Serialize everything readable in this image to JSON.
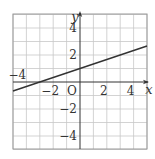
{
  "chart_data": {
    "type": "line",
    "title": "",
    "xlabel": "x",
    "ylabel": "y",
    "origin_label": "O",
    "xlim": [
      -5,
      5
    ],
    "ylim": [
      -5,
      5
    ],
    "grid": true,
    "grid_step": 1,
    "x_tick_labels": [
      {
        "value": -4,
        "text": "−4"
      },
      {
        "value": -2,
        "text": "−2"
      },
      {
        "value": 2,
        "text": "2"
      },
      {
        "value": 4,
        "text": "4"
      }
    ],
    "y_tick_labels": [
      {
        "value": 4,
        "text": "4"
      },
      {
        "value": 2,
        "text": "2"
      },
      {
        "value": -2,
        "text": "−2"
      },
      {
        "value": -4,
        "text": "−4"
      }
    ],
    "series": [
      {
        "name": "y = (1/3)x + 1",
        "slope": 0.3333,
        "intercept": 1,
        "x": [
          -5,
          -3,
          0,
          3,
          5
        ],
        "y": [
          -0.667,
          0,
          1,
          2,
          2.667
        ]
      }
    ]
  },
  "colors": {
    "grid": "#c8c8c8",
    "axis": "#333333",
    "line": "#333333",
    "background": "#ffffff"
  }
}
